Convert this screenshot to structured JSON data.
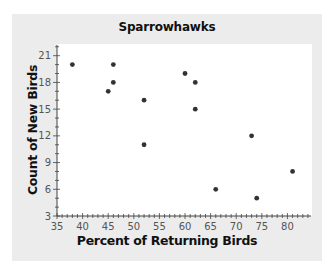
{
  "chart_data": {
    "type": "scatter",
    "title": "Sparrowhawks",
    "xlabel": "Percent of Returning Birds",
    "ylabel": "Count of New Birds",
    "xlim": [
      35,
      84.6
    ],
    "ylim": [
      3,
      22.2
    ],
    "xticks": [
      35,
      40,
      45,
      50,
      55,
      60,
      65,
      70,
      75,
      80
    ],
    "yticks": [
      3,
      6,
      9,
      12,
      15,
      18,
      21
    ],
    "grid": false,
    "legend": null,
    "points": [
      {
        "x": 38,
        "y": 20
      },
      {
        "x": 45,
        "y": 17
      },
      {
        "x": 46,
        "y": 20
      },
      {
        "x": 46,
        "y": 18
      },
      {
        "x": 52,
        "y": 16
      },
      {
        "x": 52,
        "y": 11
      },
      {
        "x": 60,
        "y": 19
      },
      {
        "x": 62,
        "y": 18
      },
      {
        "x": 62,
        "y": 15
      },
      {
        "x": 66,
        "y": 6
      },
      {
        "x": 73,
        "y": 12
      },
      {
        "x": 74,
        "y": 5
      },
      {
        "x": 81,
        "y": 8
      }
    ],
    "colors": {
      "marker": "#333333",
      "axis": "#444444",
      "panel": "#ececec",
      "plot": "#ffffff"
    }
  }
}
